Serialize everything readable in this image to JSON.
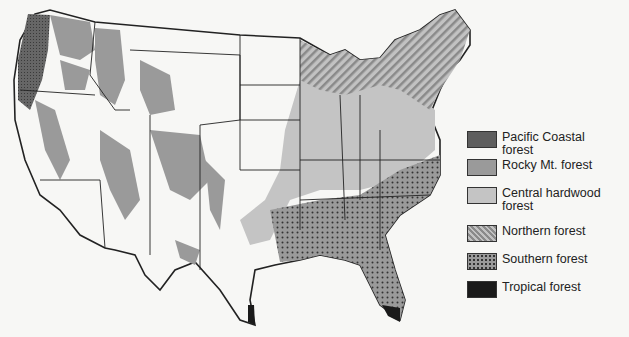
{
  "map": {
    "subject": "Forest regions of the United States",
    "colors": {
      "pacific_coastal": "#5e5e5e",
      "rocky_mt": "#9a9a9a",
      "central_hardwood": "#c4c4c4",
      "northern": "#b0b0b0",
      "southern": "#8e8e8e",
      "tropical": "#1a1a1a",
      "background": "#f7f7f5",
      "border": "#222222"
    }
  },
  "legend": {
    "items": [
      {
        "label": "Pacific Coastal forest",
        "pattern": "crosshatch-dark"
      },
      {
        "label": "Rocky Mt. forest",
        "pattern": "solid-medium"
      },
      {
        "label": "Central hardwood forest",
        "pattern": "solid-light"
      },
      {
        "label": "Northern forest",
        "pattern": "diagonal-stripes"
      },
      {
        "label": "Southern forest",
        "pattern": "dots"
      },
      {
        "label": "Tropical forest",
        "pattern": "solid-black"
      }
    ]
  }
}
